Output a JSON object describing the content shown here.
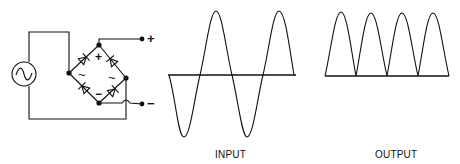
{
  "diagram": {
    "circuit": {
      "source_symbol": "~",
      "ac_terminal_labels": [
        "~",
        "~"
      ],
      "dc_positive_label": "+",
      "dc_negative_label": "−",
      "output_positive_label": "+",
      "output_negative_label": "−"
    },
    "waveforms": {
      "input_label": "INPUT",
      "output_label": "OUTPUT"
    },
    "colors": {
      "stroke": "#111111",
      "background": "#ffffff"
    }
  }
}
